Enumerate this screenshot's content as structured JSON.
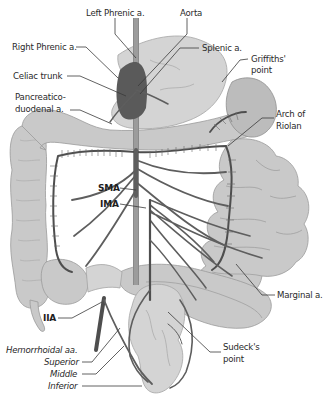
{
  "diagram": {
    "colors": {
      "background": "#ffffff",
      "bowel": "#c9c9c9",
      "stomach_light": "#d4d4d4",
      "vessel": "#5e5e5e",
      "celiac_highlight": "#5a5a5a",
      "label_text": "#2a2a2a",
      "leader_line": "#3a3a3a"
    },
    "labels": {
      "left_phrenic": "Left Phrenic a.",
      "aorta": "Aorta",
      "right_phrenic": "Right Phrenic a.",
      "splenic": "Splenic a.",
      "griffiths_1": "Griffiths'",
      "griffiths_2": "point",
      "celiac": "Celiac trunk",
      "pancreatico_1": "Pancreatico-",
      "pancreatico_2": "duodenal a.",
      "arch_1": "Arch of",
      "arch_2": "Riolan",
      "sma": "SMA",
      "ima": "IMA",
      "marginal": "Marginal a.",
      "iia": "IIA",
      "sudeck_1": "Sudeck's",
      "sudeck_2": "point",
      "hemorrhoidal": "Hemorrhoidal aa.",
      "superior": "Superior",
      "middle": "Middle",
      "inferior": "Inferior"
    }
  }
}
